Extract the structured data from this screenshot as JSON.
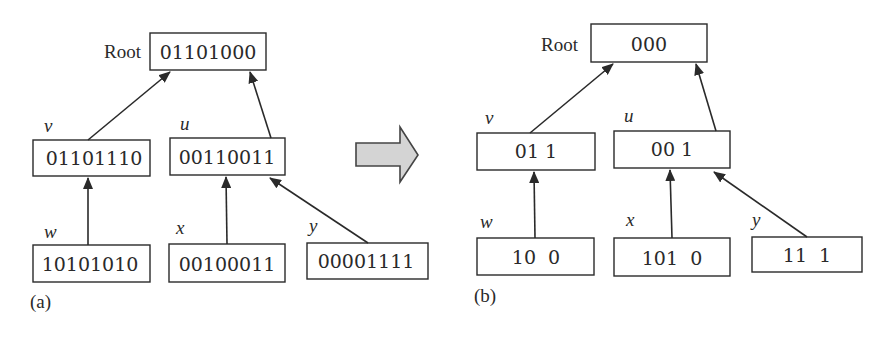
{
  "panels": [
    {
      "caption": "(a)",
      "root": {
        "label": "Root",
        "value": "01101000"
      },
      "nodes": {
        "v": {
          "name": "v",
          "value": "01101110"
        },
        "u": {
          "name": "u",
          "value": "00110011"
        },
        "w": {
          "name": "w",
          "value": "10101010"
        },
        "x": {
          "name": "x",
          "value": "00100011"
        },
        "y": {
          "name": "y",
          "value": "00001111"
        }
      }
    },
    {
      "caption": "(b)",
      "root": {
        "label": "Root",
        "value": "000"
      },
      "nodes": {
        "v": {
          "name": "v",
          "value": "01 1"
        },
        "u": {
          "name": "u",
          "value": "00 1"
        },
        "w": {
          "name": "w",
          "value": "10  0"
        },
        "x": {
          "name": "x",
          "value": "101  0"
        },
        "y": {
          "name": "y",
          "value": "11  1"
        }
      }
    }
  ],
  "edges": [
    [
      "v",
      "Root"
    ],
    [
      "u",
      "Root"
    ],
    [
      "w",
      "v"
    ],
    [
      "x",
      "u"
    ],
    [
      "y",
      "u"
    ]
  ],
  "transition_arrow": {
    "direction": "right",
    "fill": "#d4d4d4"
  }
}
